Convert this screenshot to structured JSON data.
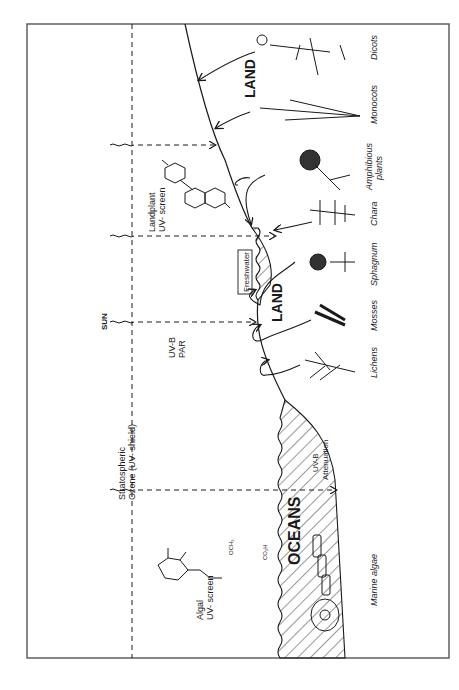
{
  "figure": {
    "orientation": "rotated-90-clockwise",
    "frame": {
      "left": 27,
      "top": 24,
      "right": 449,
      "bottom": 658
    }
  },
  "atmosphere": {
    "ozone_label_line1": "Stratospheric",
    "ozone_label_line2": "Ozone (UV- shield)",
    "sun_label": "SUN",
    "radiation_line1": "UV-B",
    "radiation_line2": "PAR"
  },
  "molecules": {
    "landplant_line1": "Landplant",
    "landplant_line2": "UV- screen",
    "algal_line1": "Algal",
    "algal_line2": "UV- screen",
    "algal_groups": {
      "och3": "OCH₃",
      "nh": "NH",
      "co2h": "CO₂H",
      "o": "O",
      "ho_oh": "HO OH"
    }
  },
  "regions": {
    "oceans": "OCEANS",
    "land_lower": "LAND",
    "land_upper": "LAND",
    "freshwater": "Freshwater",
    "uvb_attenuation_line1": "UV-B",
    "uvb_attenuation_line2": "Attenuation"
  },
  "organisms": [
    {
      "label": "Marine algae"
    },
    {
      "label": "Lichens"
    },
    {
      "label": "Mosses"
    },
    {
      "label": "Sphagnum"
    },
    {
      "label": "Chara"
    },
    {
      "label": "Amphibious",
      "label2": "plants"
    },
    {
      "label": "Monocots"
    },
    {
      "label": "Dicots"
    }
  ],
  "colors": {
    "ink": "#1a1a1a",
    "frame": "#555555",
    "background": "#ffffff"
  }
}
